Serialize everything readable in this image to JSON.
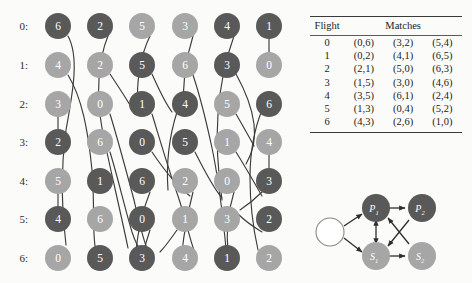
{
  "figure": {
    "background_color": "#fbfbf9",
    "node_dark_color": "#595959",
    "node_light_color": "#a6a6a6",
    "edge_color": "#3c3c3c"
  },
  "schedule": {
    "row_labels": [
      "0:",
      "1:",
      "2:",
      "3:",
      "4:",
      "5:",
      "6:"
    ],
    "columns": [
      {
        "index": 0,
        "cells": [
          {
            "value": "6",
            "shade": "dark"
          },
          {
            "value": "4",
            "shade": "light"
          },
          {
            "value": "3",
            "shade": "light"
          },
          {
            "value": "2",
            "shade": "dark"
          },
          {
            "value": "5",
            "shade": "light"
          },
          {
            "value": "4",
            "shade": "dark"
          },
          {
            "value": "0",
            "shade": "light"
          }
        ]
      },
      {
        "index": 1,
        "cells": [
          {
            "value": "2",
            "shade": "dark"
          },
          {
            "value": "2",
            "shade": "light"
          },
          {
            "value": "0",
            "shade": "light"
          },
          {
            "value": "6",
            "shade": "light"
          },
          {
            "value": "1",
            "shade": "dark"
          },
          {
            "value": "6",
            "shade": "light"
          },
          {
            "value": "5",
            "shade": "dark"
          }
        ]
      },
      {
        "index": 2,
        "cells": [
          {
            "value": "5",
            "shade": "light"
          },
          {
            "value": "5",
            "shade": "dark"
          },
          {
            "value": "1",
            "shade": "dark"
          },
          {
            "value": "0",
            "shade": "dark"
          },
          {
            "value": "6",
            "shade": "dark"
          },
          {
            "value": "0",
            "shade": "dark"
          },
          {
            "value": "3",
            "shade": "dark"
          }
        ]
      },
      {
        "index": 3,
        "cells": [
          {
            "value": "3",
            "shade": "light"
          },
          {
            "value": "6",
            "shade": "light"
          },
          {
            "value": "4",
            "shade": "dark"
          },
          {
            "value": "5",
            "shade": "dark"
          },
          {
            "value": "2",
            "shade": "light"
          },
          {
            "value": "1",
            "shade": "light"
          },
          {
            "value": "4",
            "shade": "light"
          }
        ]
      },
      {
        "index": 4,
        "cells": [
          {
            "value": "4",
            "shade": "dark"
          },
          {
            "value": "3",
            "shade": "dark"
          },
          {
            "value": "5",
            "shade": "light"
          },
          {
            "value": "1",
            "shade": "light"
          },
          {
            "value": "0",
            "shade": "light"
          },
          {
            "value": "3",
            "shade": "light"
          },
          {
            "value": "1",
            "shade": "dark"
          }
        ]
      },
      {
        "index": 5,
        "cells": [
          {
            "value": "1",
            "shade": "dark"
          },
          {
            "value": "0",
            "shade": "light"
          },
          {
            "value": "6",
            "shade": "dark"
          },
          {
            "value": "4",
            "shade": "light"
          },
          {
            "value": "3",
            "shade": "dark"
          },
          {
            "value": "2",
            "shade": "dark"
          },
          {
            "value": "2",
            "shade": "light"
          }
        ]
      }
    ]
  },
  "table": {
    "headers": [
      "Flight",
      "Matches"
    ],
    "rows": [
      {
        "flight": "0",
        "matches": [
          "(0,6)",
          "(3,2)",
          "(5,4)"
        ]
      },
      {
        "flight": "1",
        "matches": [
          "(0,2)",
          "(4,1)",
          "(6,5)"
        ]
      },
      {
        "flight": "2",
        "matches": [
          "(2,1)",
          "(5,0)",
          "(6,3)"
        ]
      },
      {
        "flight": "3",
        "matches": [
          "(1,5)",
          "(3,0)",
          "(4,6)"
        ]
      },
      {
        "flight": "4",
        "matches": [
          "(3,5)",
          "(6,1)",
          "(2,4)"
        ]
      },
      {
        "flight": "5",
        "matches": [
          "(1,3)",
          "(0,4)",
          "(5,2)"
        ]
      },
      {
        "flight": "6",
        "matches": [
          "(4,3)",
          "(2,6)",
          "(1,0)"
        ]
      }
    ]
  },
  "mini_graph": {
    "nodes": [
      {
        "id": "start",
        "label": "",
        "sub": "",
        "shade": "empty"
      },
      {
        "id": "p1",
        "label": "P",
        "sub": "1",
        "shade": "dark"
      },
      {
        "id": "p2",
        "label": "P",
        "sub": "2",
        "shade": "dark"
      },
      {
        "id": "s1",
        "label": "S",
        "sub": "1",
        "shade": "light"
      },
      {
        "id": "s2",
        "label": "S",
        "sub": "2",
        "shade": "light"
      }
    ],
    "edges": [
      {
        "from": "start",
        "to": "p1"
      },
      {
        "from": "start",
        "to": "s1"
      },
      {
        "from": "p1",
        "to": "p2"
      },
      {
        "from": "s1",
        "to": "s2"
      },
      {
        "from": "p1",
        "to": "s1",
        "bidirectional": true
      },
      {
        "from": "p2",
        "to": "s1"
      },
      {
        "from": "s2",
        "to": "p1"
      }
    ]
  }
}
